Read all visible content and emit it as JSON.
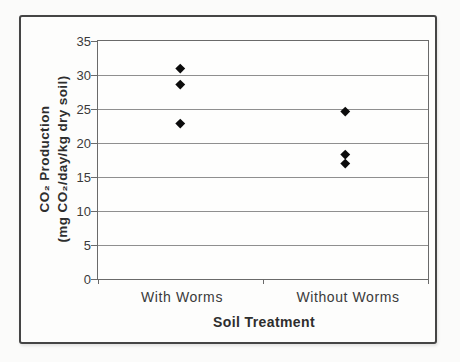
{
  "figure": {
    "y_axis_title_line1": "CO₂ Production",
    "y_axis_title_line2": "(mg CO₂/day/kg dry soil)"
  },
  "chart_data": {
    "type": "scatter",
    "title": "",
    "xlabel": "Soil Treatment",
    "ylabel": "CO₂ Production (mg CO₂/day/kg dry soil)",
    "categories": [
      "With Worms",
      "Without Worms"
    ],
    "points": [
      {
        "category": "With Worms",
        "value": 31.0
      },
      {
        "category": "With Worms",
        "value": 28.7
      },
      {
        "category": "With Worms",
        "value": 22.9
      },
      {
        "category": "Without Worms",
        "value": 24.7
      },
      {
        "category": "Without Worms",
        "value": 18.3
      },
      {
        "category": "Without Worms",
        "value": 17.0
      }
    ],
    "ylim": [
      0,
      35
    ],
    "ytick_interval": 5,
    "ytick_labels": [
      "0",
      "5",
      "10",
      "15",
      "20",
      "25",
      "30",
      "35"
    ],
    "grid": true,
    "legend": "none",
    "marker": {
      "shape": "diamond",
      "color": "#0c0c0c"
    },
    "gridline_color": "#8f8f8f",
    "axis_color": "#6a6a6a",
    "frame_border_color": "#454545"
  }
}
